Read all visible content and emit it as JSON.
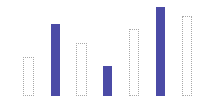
{
  "chart_data": {
    "type": "bar",
    "title": "",
    "xlabel": "",
    "ylabel": "",
    "categories": [
      "1",
      "2",
      "3",
      "4",
      "5",
      "6",
      "7"
    ],
    "values": [
      39,
      72,
      53,
      30,
      67,
      89,
      80
    ],
    "styles": [
      "outline",
      "filled",
      "outline",
      "filled",
      "outline",
      "filled",
      "outline"
    ],
    "colors": {
      "filled": "#4b4ba6",
      "outline_border": "#a8a8a8",
      "outline_fill": "#ffffff"
    },
    "ylim": [
      0,
      100
    ],
    "grid": false,
    "legend": null,
    "axes_visible": false
  },
  "layout": {
    "baseline_y": 96,
    "bar_x": [
      23,
      51,
      76,
      103,
      129,
      156,
      182
    ],
    "bar_widths": [
      11,
      9,
      11,
      9,
      10,
      9,
      10
    ]
  }
}
